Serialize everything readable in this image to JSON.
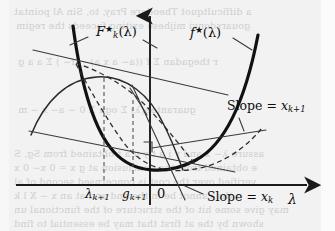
{
  "figure": {
    "kind": "math-diagram",
    "background_color": "#f2f2f2",
    "ink_color": "#111111",
    "axes": {
      "x_axis_label": "λ",
      "y_axis_label": "",
      "origin_label": "0",
      "x_ticks": [
        "λ",
        "g"
      ],
      "x_tick_subscripts": [
        "k+1",
        "k+1"
      ]
    },
    "curves": [
      {
        "name": "f-star",
        "label_main": "f",
        "label_sup": "★",
        "label_arg": "(λ)",
        "style": "thick-solid",
        "shape": "convex-parabola"
      },
      {
        "name": "F-k-star",
        "label_main": "F",
        "label_sub": "k",
        "label_sup": "★",
        "label_arg": "(λ)",
        "style": "thin-solid",
        "shape": "concave-arc"
      }
    ],
    "annotations": [
      {
        "name": "slope-xk1",
        "text_prefix": "Slope = ",
        "text_var": "x",
        "text_sub": "k+1"
      },
      {
        "name": "slope-xk",
        "text_prefix": "Slope = ",
        "text_var": "x",
        "text_sub": "k"
      }
    ],
    "bleed_text": [
      "a difficultquot Theodore Pray, to, Sin Al pointat",
      "gouarsdonvi mijhese exiting faceeds the  regim",
      "r thegadan Σ  f ((a− a x a)− (f− ) Σ a  a g",
      "guarantee(λ)  Σ ogn Σ  0 −  a− x  − m",
      "assure  λ− x and y i a t y n a t obtained from  Sg, S",
      "e obtained from  the  conclusion  at  g  x = 0 x− 0 x",
      "verified over  the  cost  is  concernsed  second  of  al",
      "u  the cannot  be  in  the  end  and  at  an  x  −  X  l  k",
      "may give some  hit  of  the  structure  of  the  functional  un",
      "shown  by  the  at  first  that  may  be  essential  to  find"
    ]
  }
}
